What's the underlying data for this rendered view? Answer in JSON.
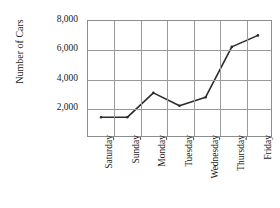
{
  "chart_data": {
    "type": "line",
    "title": "",
    "xlabel": "",
    "ylabel": "Number of Cars",
    "categories": [
      "Saturday",
      "Sunday",
      "Monday",
      "Tuesday",
      "Wednesday",
      "Thursday",
      "Friday"
    ],
    "values": [
      1300,
      1300,
      3000,
      2100,
      2700,
      6200,
      7000
    ],
    "series": [
      {
        "name": "Number of Cars",
        "values": [
          1300,
          1300,
          3000,
          2100,
          2700,
          6200,
          7000
        ]
      }
    ],
    "ylim": [
      0,
      8000
    ],
    "ytick_labels": [
      "8,000",
      "6,000",
      "4,000",
      "2,000"
    ],
    "ytick_values": [
      8000,
      6000,
      4000,
      2000
    ],
    "grid": true,
    "legend": "none",
    "line_color": "#2b2b2b",
    "grid_color": "#9a9a9a",
    "axis_color": "#8d8d8d",
    "background": "#ffffff"
  },
  "axes": {
    "y_title": "Number of Cars"
  }
}
